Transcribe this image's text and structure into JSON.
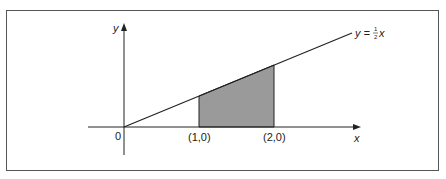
{
  "diagram": {
    "y_axis_label": "y",
    "x_axis_label": "x",
    "origin_label": "0",
    "line_label_prefix": "y = ",
    "line_label_num": "1",
    "line_label_den": "2",
    "line_label_suffix": "x",
    "point_labels": [
      "(1,0)",
      "(2,0)"
    ],
    "colors": {
      "shade": "#9a9a9a",
      "line": "#222222",
      "frame": "#555555"
    }
  }
}
